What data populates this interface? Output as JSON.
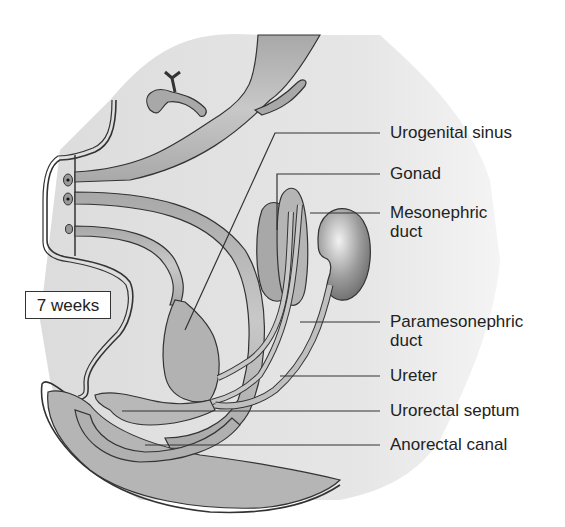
{
  "figure": {
    "stage_label": "7 weeks",
    "labels": [
      {
        "id": "urogenital-sinus",
        "line1": "Urogenital sinus",
        "line2": ""
      },
      {
        "id": "gonad",
        "line1": "Gonad",
        "line2": ""
      },
      {
        "id": "mesonephric-duct",
        "line1": "Mesonephric",
        "line2": "duct"
      },
      {
        "id": "paramesonephric-duct",
        "line1": "Paramesonephric",
        "line2": "duct"
      },
      {
        "id": "ureter",
        "line1": "Ureter",
        "line2": ""
      },
      {
        "id": "urorectal-septum",
        "line1": "Urorectal septum",
        "line2": ""
      },
      {
        "id": "anorectal-canal",
        "line1": "Anorectal canal",
        "line2": ""
      }
    ]
  },
  "colors": {
    "background": "#ffffff",
    "tissue_light": "#e4e4e4",
    "tissue_mid": "#bdbdbd",
    "tissue_dark": "#9a9a9a",
    "outline": "#333333",
    "text": "#222222"
  }
}
